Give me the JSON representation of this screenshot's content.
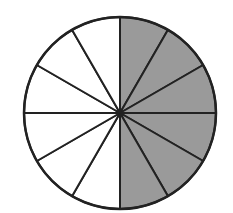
{
  "figure": {
    "total_sectors": 12,
    "shaded_sectors": 6,
    "shaded_color": "#9a9a9a",
    "unshaded_color": "#ffffff",
    "stroke_color": "#222222",
    "center": [
      120,
      113
    ],
    "radius": 96,
    "shaded_side": "right"
  }
}
